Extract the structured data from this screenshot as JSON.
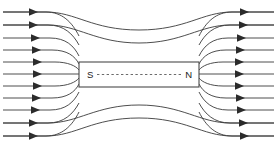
{
  "diagram": {
    "background_color": "#ffffff",
    "line_color": "#3a3a3a",
    "arrow_color": "#2b2b2b",
    "magnet": {
      "name": "bar-magnet",
      "fill_color": "#ffffff",
      "border_color": "#4a4a4a",
      "x": 79,
      "y": 62,
      "width": 120,
      "height": 25,
      "axis_color": "#6b6b6b",
      "axis_style": "dashed",
      "south_pole_label": "S",
      "north_pole_label": "N"
    },
    "flow_direction": "left-to-right",
    "arrow_count_left": 11,
    "arrow_count_right": 11,
    "field_lines": {
      "left_incoming_count": 11,
      "right_outgoing_count": 11,
      "over_arc_count": 2,
      "under_arc_count": 2
    }
  }
}
